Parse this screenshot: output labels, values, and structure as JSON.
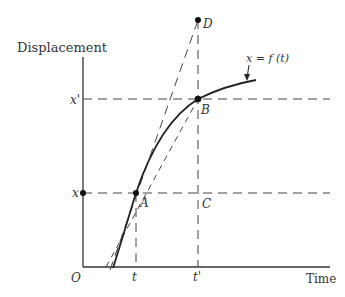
{
  "diagram": {
    "y_axis_label": "Displacement",
    "x_axis_label": "Time",
    "origin_label": "O",
    "curve_label": "x = f (t)",
    "tick_labels": {
      "x": "x",
      "x_prime": "x'",
      "t": "t",
      "t_prime": "t'"
    },
    "points": {
      "A": "A",
      "B": "B",
      "C": "C",
      "D": "D"
    },
    "colors": {
      "ink": "#333333",
      "background": "#ffffff"
    }
  }
}
